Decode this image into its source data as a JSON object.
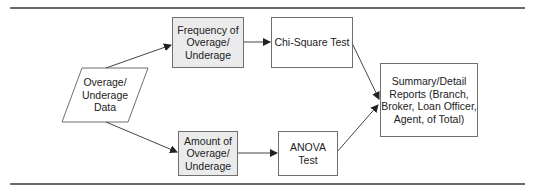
{
  "diagram": {
    "nodes": {
      "input": {
        "label": "Overage/\nUnderage\nData",
        "shape": "parallelogram"
      },
      "frequency": {
        "label": "Frequency of\nOverage/\nUnderage",
        "shape": "rect",
        "fill": "#ebebeb"
      },
      "chi_square": {
        "label": "Chi-Square Test",
        "shape": "rect",
        "fill": "#ffffff"
      },
      "amount": {
        "label": "Amount of\nOverage/\nUnderage",
        "shape": "rect",
        "fill": "#ebebeb"
      },
      "anova": {
        "label": "ANOVA\nTest",
        "shape": "rect",
        "fill": "#ffffff"
      },
      "summary": {
        "label": "Summary/Detail\nReports (Branch,\nBroker, Loan Officer,\nAgent, of Total)",
        "shape": "rect",
        "fill": "#ffffff"
      }
    },
    "edges": [
      {
        "from": "input",
        "to": "frequency"
      },
      {
        "from": "input",
        "to": "amount"
      },
      {
        "from": "frequency",
        "to": "chi_square"
      },
      {
        "from": "amount",
        "to": "anova"
      },
      {
        "from": "chi_square",
        "to": "summary"
      },
      {
        "from": "anova",
        "to": "summary"
      }
    ]
  }
}
